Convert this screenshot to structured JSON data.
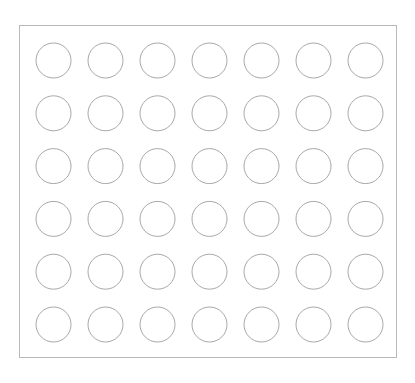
{
  "grid": {
    "rows": 6,
    "cols": 7,
    "origin_x": 36,
    "origin_y": 43,
    "pitch_x": 52,
    "pitch_y": 52.8,
    "diameter": 35,
    "stroke": "#a8a8a8",
    "fill": "#ffffff"
  },
  "frame": {
    "stroke": "#b8b8b8"
  }
}
